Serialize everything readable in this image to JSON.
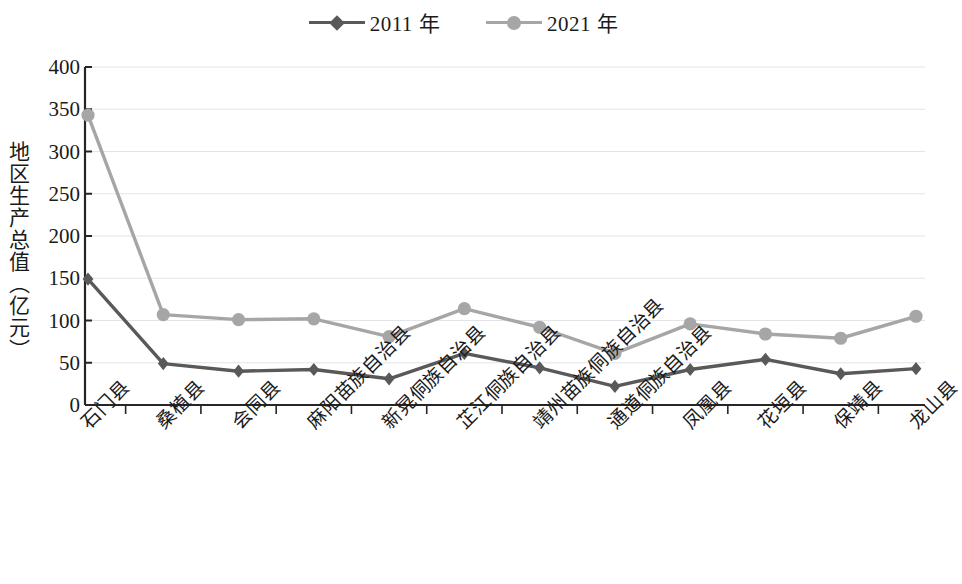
{
  "chart_data": {
    "type": "line",
    "title": "",
    "xlabel": "",
    "ylabel": "地区生产总值（亿元）",
    "ylim": [
      0,
      400
    ],
    "ytick_step": 50,
    "yticks": [
      "400",
      "350",
      "300",
      "250",
      "200",
      "150",
      "100",
      "50",
      "0"
    ],
    "grid": true,
    "legend_position": "top-center",
    "categories": [
      "石门县",
      "桑植县",
      "会同县",
      "麻阳苗族自治县",
      "新晃侗族自治县",
      "芷江侗族自治县",
      "靖州苗族侗族自治县",
      "通道侗族自治县",
      "凤凰县",
      "花垣县",
      "保靖县",
      "龙山县"
    ],
    "series": [
      {
        "name": "2011 年",
        "color": "#595959",
        "marker": "diamond",
        "values": [
          149,
          49,
          40,
          42,
          31,
          61,
          44,
          22,
          42,
          54,
          37,
          43
        ]
      },
      {
        "name": "2021 年",
        "color": "#a6a6a6",
        "marker": "circle",
        "values": [
          343,
          107,
          101,
          102,
          81,
          114,
          92,
          61,
          96,
          84,
          79,
          105
        ]
      }
    ]
  },
  "axis": {
    "line_color": "#262626",
    "grid_color": "#e3e3ea"
  }
}
